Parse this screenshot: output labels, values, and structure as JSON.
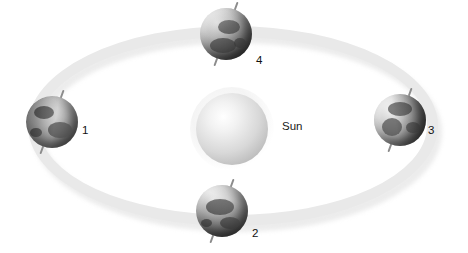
{
  "diagram": {
    "title": "",
    "sun": {
      "label": "Sun",
      "color": "#d8d8d8"
    },
    "orbit": {
      "color": "#e9e9e9",
      "shape": "ellipse"
    },
    "earth_positions": [
      {
        "number": "1",
        "location": "left",
        "axis_tilt_deg": "20"
      },
      {
        "number": "2",
        "location": "bottom",
        "axis_tilt_deg": "20"
      },
      {
        "number": "3",
        "location": "right",
        "axis_tilt_deg": "20"
      },
      {
        "number": "4",
        "location": "top",
        "axis_tilt_deg": "20"
      }
    ]
  }
}
